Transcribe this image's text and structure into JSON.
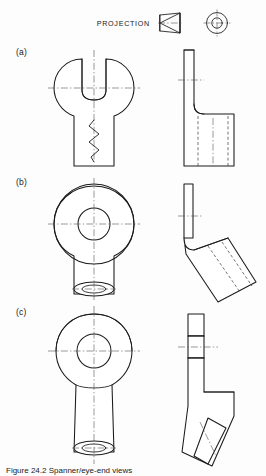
{
  "sheet": {
    "background_color": "#fdfdfd",
    "line_color": "#1a1a1a",
    "caption": "Figure 24.2  Spanner/eye-end views"
  },
  "header": {
    "projection_label": "PROJECTION",
    "projection_type": "first-angle",
    "cone_icon_name": "truncated-cone-icon",
    "circles_icon_name": "concentric-circles-icon"
  },
  "rows": [
    {
      "label": "(a)",
      "description": "Open-jaw spanner head, front view with break line; side view L-profile with hidden edges",
      "front_view": {
        "name": "spanner-open-jaw-front-view",
        "features": [
          "circular head",
          "open jaw slot",
          "parallel shank",
          "zig-zag break line",
          "horizontal centre line",
          "vertical centre line"
        ]
      },
      "side_view": {
        "name": "spanner-open-jaw-side-view",
        "features": [
          "thin upright blade",
          "stepped foot",
          "hidden dashed edges",
          "short centre line"
        ]
      }
    },
    {
      "label": "(b)",
      "description": "Closed eye end, front view with bored hole; side view swept/angled blade",
      "front_view": {
        "name": "eye-end-front-view",
        "features": [
          "outer circle",
          "inner bore circle",
          "parallel shank",
          "tube end double ellipse",
          "centre lines"
        ]
      },
      "side_view": {
        "name": "eye-end-side-view",
        "features": [
          "thin upright blade",
          "angled swept body",
          "hidden dashed edges",
          "short centre line"
        ]
      }
    },
    {
      "label": "(c)",
      "description": "Tapered eye end, front view; side view shown in section with hatching",
      "front_view": {
        "name": "tapered-eye-front-view",
        "features": [
          "rounded eye boss",
          "bore circle",
          "tapered shank",
          "tube end double ellipse",
          "centre lines"
        ]
      },
      "side_view": {
        "name": "tapered-eye-sectioned-side-view",
        "features": [
          "section hatching",
          "bore gap",
          "angled lower limb",
          "centre line"
        ]
      }
    }
  ]
}
